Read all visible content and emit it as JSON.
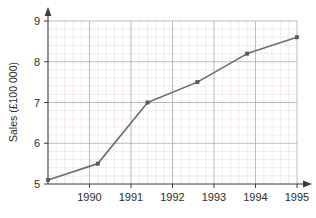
{
  "chart_data": {
    "type": "line",
    "title": "",
    "subtitle": "",
    "xlabel": "",
    "ylabel": "Sales (£100 000)",
    "categories": [
      "1990",
      "1991",
      "1992",
      "1993",
      "1994",
      "1995"
    ],
    "x": [
      1990,
      1991,
      1992,
      1993,
      1994,
      1995
    ],
    "values": [
      5.1,
      5.5,
      7.0,
      7.5,
      8.2,
      8.6
    ],
    "series": [
      {
        "name": "Sales",
        "values": [
          5.1,
          5.5,
          7.0,
          7.5,
          8.2,
          8.6
        ]
      }
    ],
    "xlim": [
      1989.6,
      1995.6
    ],
    "ylim": [
      5,
      9
    ],
    "x_tick_labels": [
      "1990",
      "1991",
      "1992",
      "1993",
      "1994",
      "1995"
    ],
    "y_tick_labels": [
      "5",
      "6",
      "7",
      "8",
      "9"
    ],
    "y_ticks": [
      5,
      6,
      7,
      8,
      9
    ],
    "grid": true,
    "grid_minor": true,
    "minor_divisions_per_unit": 5,
    "legend": false,
    "legend_position": "none",
    "markers": true,
    "marker_shape": "square",
    "axis_arrows": true,
    "colors": {
      "line": "#6b6b72",
      "marker": "#5a5a61",
      "axis": "#3a3a3a",
      "grid_major": "#a9a9ad",
      "grid_minor": "#e8d9dc",
      "background": "#ffffff",
      "text": "#2b2b2b"
    },
    "annotations": []
  },
  "axis": {
    "y_title": "Sales (£100 000)",
    "y_labels": {
      "t5": "5",
      "t6": "6",
      "t7": "7",
      "t8": "8",
      "t9": "9"
    },
    "x_labels": {
      "t1990": "1990",
      "t1991": "1991",
      "t1992": "1992",
      "t1993": "1993",
      "t1994": "1994",
      "t1995": "1995"
    }
  }
}
